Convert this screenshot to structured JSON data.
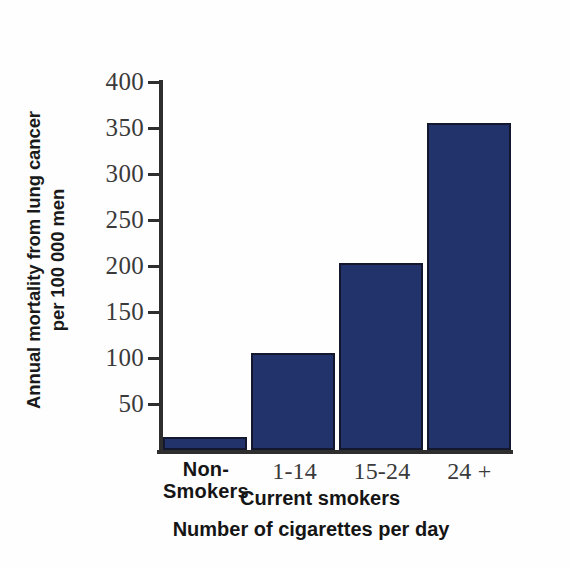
{
  "chart_data": {
    "type": "bar",
    "title": "",
    "xlabel": "Number of cigarettes per day",
    "ylabel": "Annual mortality from lung cancer per 100 000 men",
    "ylabel_line1": "Annual mortality from lung cancer",
    "ylabel_line2": "per 100 000 men",
    "categories": [
      "Non-Smokers",
      "1-14",
      "15-24",
      "24 +"
    ],
    "category_display": [
      {
        "line1": "Non-",
        "line2": "Smokers",
        "style": "bold"
      },
      {
        "line1": "1-14",
        "line2": "",
        "style": "plain"
      },
      {
        "line1": "15-24",
        "line2": "",
        "style": "plain"
      },
      {
        "line1": "24 +",
        "line2": "",
        "style": "plain"
      }
    ],
    "group_label": "Current smokers",
    "values": [
      14,
      105,
      203,
      355
    ],
    "ylim": [
      0,
      400
    ],
    "yticks": [
      400,
      350,
      300,
      250,
      200,
      150,
      100,
      50
    ],
    "ytick_labels": [
      "400",
      "350",
      "300",
      "250",
      "200",
      "150",
      "100",
      "50"
    ],
    "grid": false,
    "legend": "none",
    "bar_color": "#22336b",
    "bar_edge_color": "#14182e",
    "axis_color": "#2e2e2e",
    "background": "#ffffff"
  }
}
